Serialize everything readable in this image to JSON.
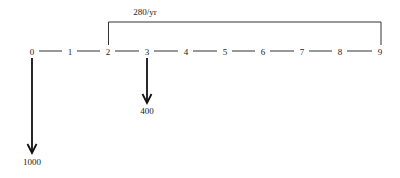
{
  "diagram": {
    "type": "cash-flow-diagram",
    "timeline": {
      "periods": [
        "0",
        "1",
        "2",
        "3",
        "4",
        "5",
        "6",
        "7",
        "8",
        "9"
      ],
      "x_positions": [
        32,
        70,
        108,
        147,
        186,
        225,
        263,
        302,
        340,
        380
      ],
      "y": 52
    },
    "annuity": {
      "label": "280/yr",
      "from_period": "2",
      "to_period": "9",
      "direction": "up"
    },
    "cash_flows": [
      {
        "period": "0",
        "amount": "1000",
        "direction": "down"
      },
      {
        "period": "3",
        "amount": "400",
        "direction": "down"
      }
    ],
    "colors": {
      "line": "#333333",
      "text": "#222222",
      "background": "#ffffff"
    }
  }
}
